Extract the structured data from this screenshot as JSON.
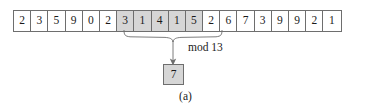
{
  "figure": {
    "caption": "(a)",
    "type": "rolling-hash-window-diagram"
  },
  "strip": {
    "cells": [
      {
        "value": "2",
        "highlighted": false
      },
      {
        "value": "3",
        "highlighted": false
      },
      {
        "value": "5",
        "highlighted": false
      },
      {
        "value": "9",
        "highlighted": false
      },
      {
        "value": "0",
        "highlighted": false
      },
      {
        "value": "2",
        "highlighted": false
      },
      {
        "value": "3",
        "highlighted": true
      },
      {
        "value": "1",
        "highlighted": true
      },
      {
        "value": "4",
        "highlighted": true
      },
      {
        "value": "1",
        "highlighted": true
      },
      {
        "value": "5",
        "highlighted": true
      },
      {
        "value": "2",
        "highlighted": false
      },
      {
        "value": "6",
        "highlighted": false
      },
      {
        "value": "7",
        "highlighted": false
      },
      {
        "value": "3",
        "highlighted": false
      },
      {
        "value": "9",
        "highlighted": false
      },
      {
        "value": "9",
        "highlighted": false
      },
      {
        "value": "2",
        "highlighted": false
      },
      {
        "value": "1",
        "highlighted": false
      }
    ],
    "highlighted_window": "31415"
  },
  "operation": {
    "label": "mod 13"
  },
  "result": {
    "value": "7"
  },
  "colors": {
    "highlight_fill": "#d6d6d6",
    "cell_border": "#6e6e6e",
    "background": "#ffffff",
    "text": "#1a1a1a",
    "line": "#555555"
  }
}
